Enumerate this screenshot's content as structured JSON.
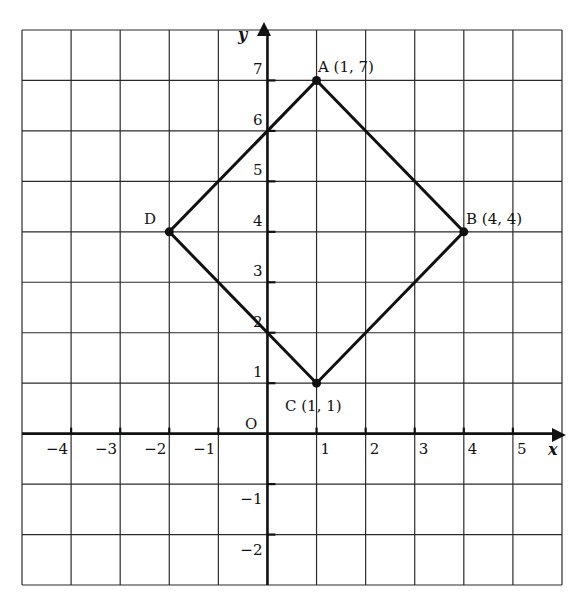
{
  "chart_data": {
    "type": "diagram",
    "title": "",
    "xlabel": "x",
    "ylabel": "y",
    "origin_label": "O",
    "xlim": [
      -5,
      6
    ],
    "ylim": [
      -3,
      8
    ],
    "grid": true,
    "x_tick_labels": [
      "-4",
      "-3",
      "-2",
      "-1",
      "1",
      "2",
      "3",
      "4",
      "5"
    ],
    "x_ticks": [
      -4,
      -3,
      -2,
      -1,
      1,
      2,
      3,
      4,
      5
    ],
    "y_tick_labels": [
      "7",
      "6",
      "5",
      "4",
      "3",
      "2",
      "1",
      "-1",
      "-2"
    ],
    "y_ticks": [
      7,
      6,
      5,
      4,
      3,
      2,
      1,
      -1,
      -2
    ],
    "points": [
      {
        "name": "A",
        "x": 1,
        "y": 7,
        "label": "A (1, 7)"
      },
      {
        "name": "B",
        "x": 4,
        "y": 4,
        "label": "B (4, 4)"
      },
      {
        "name": "C",
        "x": 1,
        "y": 1,
        "label": "C (1, 1)"
      },
      {
        "name": "D",
        "x": -2,
        "y": 4,
        "label": "D"
      }
    ],
    "polygon": [
      "A",
      "B",
      "C",
      "D"
    ]
  },
  "labels": {
    "x_axis": "x",
    "y_axis": "y",
    "origin": "O",
    "point_a": "A (1, 7)",
    "point_b": "B (4, 4)",
    "point_c": "C (1, 1)",
    "point_d": "D"
  }
}
